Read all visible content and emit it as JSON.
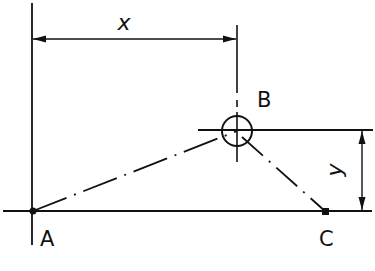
{
  "diagram": {
    "type": "geometric-dimension-drawing",
    "colors": {
      "ink": "#111111",
      "background": "#ffffff"
    },
    "points": {
      "A": {
        "label": "A",
        "x": 33,
        "y": 211,
        "marker": "filled-dot"
      },
      "B": {
        "label": "B",
        "x": 237,
        "y": 131,
        "marker": "circle-with-crosshair",
        "radius": 15
      },
      "C": {
        "label": "C",
        "x": 326,
        "y": 212,
        "marker": "filled-square"
      }
    },
    "dimensions": {
      "x": {
        "label": "x",
        "from": "A-vertical",
        "to": "B-vertical",
        "orientation": "horizontal"
      },
      "y": {
        "label": "y",
        "from": "baseline",
        "to": "B-horizontal",
        "orientation": "vertical",
        "label_rotated": true
      }
    },
    "segments": [
      {
        "from": "A",
        "to": "B",
        "style": "dash-dot"
      },
      {
        "from": "B",
        "to": "C",
        "style": "dash-dot"
      }
    ]
  }
}
